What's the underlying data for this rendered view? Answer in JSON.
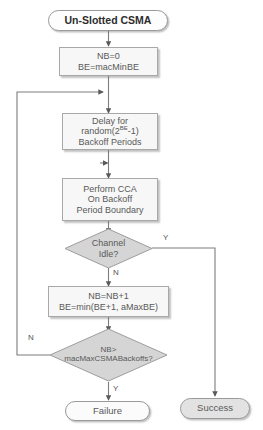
{
  "diagram": {
    "type": "flowchart",
    "nodes": {
      "start": {
        "label": "Un-Slotted CSMA",
        "shape": "terminal"
      },
      "init": {
        "line1": "NB=0",
        "line2": "BE=macMinBE",
        "shape": "process"
      },
      "delay": {
        "line1": "Delay for",
        "line2_pre": "random(2",
        "line2_sup": "BE",
        "line2_post": "-1)",
        "line3": "Backoff Periods",
        "shape": "process"
      },
      "cca": {
        "line1": "Perform CCA",
        "line2": "On Backoff",
        "line3": "Period Boundary",
        "shape": "process"
      },
      "idle": {
        "line1": "Channel",
        "line2": "Idle?",
        "shape": "decision"
      },
      "increment": {
        "line1": "NB=NB+1",
        "line2": "BE=min(BE+1, aMaxBE)",
        "shape": "process"
      },
      "maxbackoff": {
        "line1": "NB>",
        "line2": "macMaxCSMABackoffs?",
        "shape": "decision"
      },
      "failure": {
        "label": "Failure",
        "shape": "terminal"
      },
      "success": {
        "label": "Success",
        "shape": "terminal"
      }
    },
    "branch_labels": {
      "idle_yes": "Y",
      "idle_no": "N",
      "maxbackoff_no": "N",
      "maxbackoff_yes": "Y"
    },
    "colors": {
      "line": "#808080",
      "decision_fill": "#d5d5d5",
      "process_fill": "#f7f7f7",
      "terminal_gray_fill": "#e2e2e2",
      "text": "#595959"
    }
  }
}
